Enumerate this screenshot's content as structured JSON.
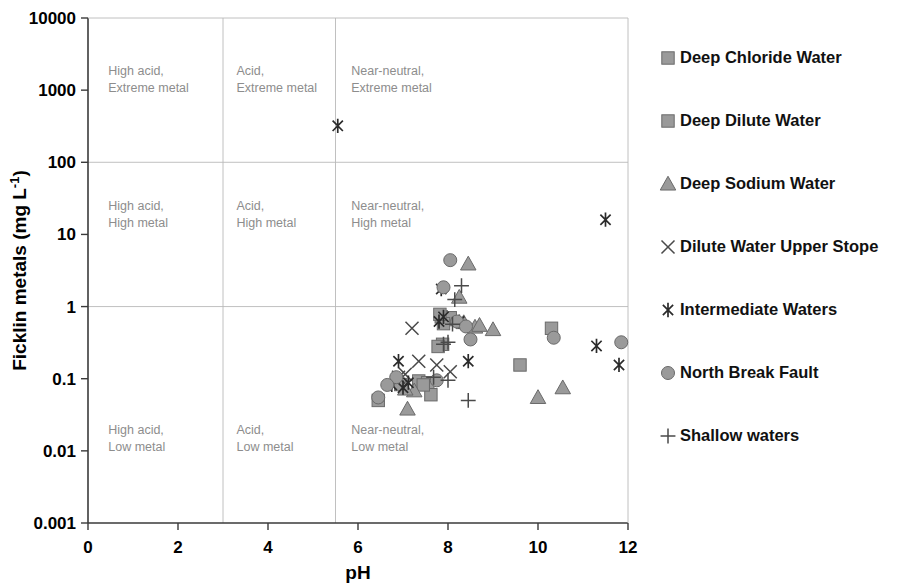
{
  "chart_data": {
    "type": "scatter",
    "title": "",
    "xlabel": "pH",
    "ylabel": "Ficklin metals  (mg L-1)",
    "ylabel_base": "Ficklin metals  (mg L",
    "ylabel_sup": "-1",
    "ylabel_close": ")",
    "xlim": [
      0,
      12
    ],
    "ylim": [
      0.001,
      10000
    ],
    "yscale": "log",
    "xticks": [
      "0",
      "2",
      "4",
      "6",
      "8",
      "10",
      "12"
    ],
    "xtick_values": [
      0,
      2,
      4,
      6,
      8,
      10,
      12
    ],
    "yticks": [
      "0.001",
      "0.01",
      "0.1",
      "1",
      "10",
      "100",
      "1000",
      "10000"
    ],
    "ytick_values": [
      0.001,
      0.01,
      0.1,
      1,
      10,
      100,
      1000,
      10000
    ],
    "grid": "partial",
    "gridlines_y": [
      1,
      100
    ],
    "dividers_x": [
      3,
      5.5
    ],
    "legend_position": "right",
    "marker_color": "#9a9a9a",
    "marker_edge_color": "#6a6a6a",
    "stroke_color": "#2b2b2b",
    "grid_color": "#b9b9b9",
    "annotation_color": "#8d8d8d",
    "annotations": [
      {
        "text_line1": "High acid,",
        "text_line2": "Extreme metal",
        "x": 0.45,
        "y": 1600
      },
      {
        "text_line1": "Acid,",
        "text_line2": "Extreme metal",
        "x": 3.3,
        "y": 1600
      },
      {
        "text_line1": "Near-neutral,",
        "text_line2": "Extreme metal",
        "x": 5.85,
        "y": 1600
      },
      {
        "text_line1": "High acid,",
        "text_line2": "High metal",
        "x": 0.45,
        "y": 22
      },
      {
        "text_line1": "Acid,",
        "text_line2": "High metal",
        "x": 3.3,
        "y": 22
      },
      {
        "text_line1": "Near-neutral,",
        "text_line2": "High metal",
        "x": 5.85,
        "y": 22
      },
      {
        "text_line1": "High acid,",
        "text_line2": "Low metal",
        "x": 0.45,
        "y": 0.017
      },
      {
        "text_line1": "Acid,",
        "text_line2": "Low metal",
        "x": 3.3,
        "y": 0.017
      },
      {
        "text_line1": "Near-neutral,",
        "text_line2": "Low metal",
        "x": 5.85,
        "y": 0.017
      }
    ],
    "series": [
      {
        "name": "Deep Chloride Water",
        "marker": "square",
        "points": [
          [
            7.85,
            0.72
          ],
          [
            7.95,
            0.66
          ],
          [
            8.05,
            0.7
          ],
          [
            7.88,
            0.3
          ],
          [
            7.35,
            0.093
          ],
          [
            7.55,
            0.088
          ],
          [
            7.62,
            0.06
          ],
          [
            10.3,
            0.5
          ],
          [
            9.6,
            0.155
          ],
          [
            7.9,
            0.58
          ],
          [
            6.45,
            0.05
          ]
        ]
      },
      {
        "name": "Deep Dilute Water",
        "marker": "square",
        "points": [
          [
            7.82,
            0.78
          ],
          [
            7.78,
            0.28
          ],
          [
            7.45,
            0.082
          ],
          [
            6.95,
            0.083
          ]
        ]
      },
      {
        "name": "Deep Sodium Water",
        "marker": "triangle",
        "points": [
          [
            8.45,
            3.9
          ],
          [
            8.25,
            1.35
          ],
          [
            8.6,
            0.52
          ],
          [
            8.7,
            0.55
          ],
          [
            8.35,
            0.6
          ],
          [
            7.25,
            0.068
          ],
          [
            7.1,
            0.038
          ],
          [
            9.0,
            0.48
          ],
          [
            10.55,
            0.075
          ],
          [
            10.0,
            0.055
          ],
          [
            7.05,
            0.072
          ]
        ]
      },
      {
        "name": "Dilute Water Upper Stope",
        "marker": "x",
        "points": [
          [
            7.2,
            0.5
          ],
          [
            7.75,
            0.155
          ],
          [
            8.05,
            0.125
          ],
          [
            7.35,
            0.175
          ],
          [
            6.9,
            0.105
          ],
          [
            7.05,
            0.115
          ]
        ]
      },
      {
        "name": "Intermediate Waters",
        "marker": "asterisk",
        "points": [
          [
            5.55,
            320
          ],
          [
            11.5,
            16
          ],
          [
            7.85,
            1.75
          ],
          [
            7.9,
            0.72
          ],
          [
            7.8,
            0.62
          ],
          [
            8.25,
            0.62
          ],
          [
            8.45,
            0.175
          ],
          [
            11.3,
            0.285
          ],
          [
            11.8,
            0.155
          ],
          [
            6.9,
            0.175
          ],
          [
            6.75,
            0.082
          ],
          [
            7.0,
            0.075
          ],
          [
            7.12,
            0.088
          ]
        ]
      },
      {
        "name": "North Break Fault",
        "marker": "circle",
        "points": [
          [
            8.05,
            4.4
          ],
          [
            7.9,
            1.85
          ],
          [
            8.2,
            0.62
          ],
          [
            8.4,
            0.53
          ],
          [
            8.5,
            0.35
          ],
          [
            10.35,
            0.37
          ],
          [
            11.85,
            0.32
          ],
          [
            6.85,
            0.105
          ],
          [
            6.65,
            0.082
          ],
          [
            6.45,
            0.055
          ],
          [
            7.75,
            0.095
          ]
        ]
      },
      {
        "name": "Shallow waters",
        "marker": "plus",
        "points": [
          [
            8.3,
            1.95
          ],
          [
            8.15,
            1.25
          ],
          [
            8.0,
            0.32
          ],
          [
            8.1,
            0.57
          ],
          [
            7.9,
            0.3
          ],
          [
            8.45,
            0.05
          ],
          [
            8.0,
            0.095
          ],
          [
            7.68,
            0.105
          ]
        ]
      }
    ]
  },
  "legend": {
    "items": [
      {
        "label": "Deep Chloride Water",
        "marker": "square"
      },
      {
        "label": "Deep Dilute Water",
        "marker": "square"
      },
      {
        "label": "Deep Sodium Water",
        "marker": "triangle"
      },
      {
        "label": "Dilute Water Upper Stope",
        "marker": "x"
      },
      {
        "label": "Intermediate Waters",
        "marker": "asterisk"
      },
      {
        "label": "North Break Fault",
        "marker": "circle"
      },
      {
        "label": "Shallow waters",
        "marker": "plus"
      }
    ]
  }
}
